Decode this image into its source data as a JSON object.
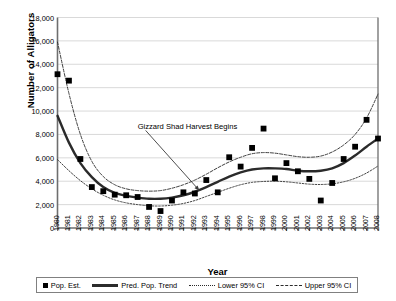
{
  "chart_data": {
    "type": "line",
    "title": "",
    "xlabel": "Year",
    "ylabel": "Number of Alligators",
    "xlim": [
      1980,
      2008
    ],
    "ylim": [
      0,
      18000
    ],
    "ytick_step": 2000,
    "grid": "horizontal",
    "legend_position": "bottom",
    "ytick_labels": [
      "0",
      "2,000",
      "4,000",
      "6,000",
      "8,000",
      "10,000",
      "12,000",
      "14,000",
      "16,000",
      "18,000"
    ],
    "ytick_values": [
      0,
      2000,
      4000,
      6000,
      8000,
      10000,
      12000,
      14000,
      16000,
      18000
    ],
    "categories": [
      1980,
      1981,
      1982,
      1983,
      1984,
      1985,
      1986,
      1987,
      1988,
      1989,
      1990,
      1991,
      1992,
      1993,
      1994,
      1995,
      1996,
      1997,
      1998,
      1999,
      2000,
      2001,
      2002,
      2003,
      2004,
      2005,
      2006,
      2007,
      2008
    ],
    "xtick_labels": [
      "1980",
      "1981",
      "1982",
      "1983",
      "1984",
      "1985",
      "1986",
      "1987",
      "1988",
      "1989",
      "1990",
      "1991",
      "1992",
      "1993",
      "1994",
      "1995",
      "1996",
      "1997",
      "1998",
      "1999",
      "2000",
      "2001",
      "2002",
      "2003",
      "2004",
      "2005",
      "2006",
      "2007",
      "2008"
    ],
    "series": [
      {
        "name": "Pop. Est.",
        "type": "scatter",
        "marker": "square",
        "color": "#000000",
        "values": [
          13150,
          12600,
          5900,
          3500,
          3150,
          2850,
          2800,
          2650,
          1800,
          1450,
          2350,
          3050,
          2950,
          4100,
          3050,
          6050,
          5250,
          6850,
          8500,
          4250,
          5550,
          4850,
          4200,
          2350,
          3850,
          5900,
          6950,
          9250,
          7650
        ]
      },
      {
        "name": "Pred. Pop. Trend",
        "type": "line",
        "style": "solid",
        "color": "#2b2b2b",
        "values": [
          9600,
          7300,
          5550,
          4350,
          3500,
          3000,
          2750,
          2600,
          2500,
          2500,
          2600,
          2800,
          3100,
          3500,
          3950,
          4400,
          4750,
          5000,
          5100,
          5100,
          5050,
          4900,
          4850,
          4900,
          5100,
          5550,
          6200,
          6950,
          7650
        ]
      },
      {
        "name": "Lower 95% CI",
        "type": "line",
        "style": "dotted",
        "color": "#2b2b2b",
        "values": [
          5850,
          4900,
          4050,
          3350,
          2800,
          2400,
          2150,
          2000,
          1900,
          1880,
          1950,
          2100,
          2350,
          2700,
          3050,
          3400,
          3700,
          3900,
          3980,
          4000,
          3950,
          3850,
          3750,
          3720,
          3780,
          3950,
          4250,
          4700,
          5300
        ]
      },
      {
        "name": "Upper 95% CI",
        "type": "line",
        "style": "dashed",
        "color": "#2b2b2b",
        "values": [
          15900,
          11500,
          8000,
          5700,
          4400,
          3700,
          3350,
          3200,
          3150,
          3200,
          3400,
          3700,
          4100,
          4600,
          5150,
          5650,
          6050,
          6350,
          6450,
          6400,
          6250,
          6100,
          6050,
          6150,
          6500,
          7100,
          8000,
          9400,
          11450
        ]
      }
    ],
    "annotations": [
      {
        "text": "Gizzard Shad Harvest Begins",
        "text_x": 1987.0,
        "text_y": 8600,
        "arrow_to_x": 1992.4,
        "arrow_to_y": 3200
      }
    ]
  },
  "legend": {
    "items": [
      {
        "label": "Pop. Est.",
        "glyph": "square-marker"
      },
      {
        "label": "Pred. Pop. Trend",
        "glyph": "solid-line"
      },
      {
        "label": "Lower 95% CI",
        "glyph": "dotted-line"
      },
      {
        "label": "Upper 95% CI",
        "glyph": "dashed-line"
      }
    ]
  }
}
